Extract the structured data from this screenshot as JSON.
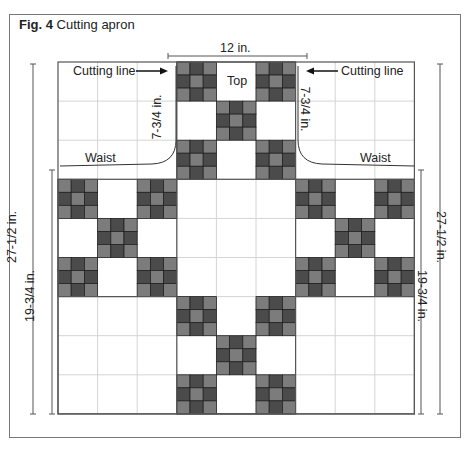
{
  "figure": {
    "number_label": "Fig. 4",
    "title": "Cutting apron"
  },
  "labels": {
    "top_width": "12 in.",
    "top": "Top",
    "cutting_line_left": "Cutting line",
    "cutting_line_right": "Cutting line",
    "cut_depth_left": "7-3/4 in.",
    "cut_depth_right": "7-3/4 in.",
    "waist_left": "Waist",
    "waist_right": "Waist",
    "total_height_left": "27-1/2 in.",
    "total_height_right": "27-1/2 in.",
    "skirt_height_left": "19-3/4 in.",
    "skirt_height_right": "19-3/4 in."
  },
  "colors": {
    "block_medium": "#7c7c7c",
    "block_dark": "#4b4b4b",
    "outline": "#555555",
    "grid_light": "#d4d4d4",
    "frame": "#777777"
  },
  "quilt": {
    "grid_cols": 9,
    "grid_rows": 9,
    "ninepatch_cells": [
      [
        3,
        0
      ],
      [
        5,
        0
      ],
      [
        4,
        1
      ],
      [
        3,
        2
      ],
      [
        5,
        2
      ],
      [
        0,
        3
      ],
      [
        2,
        3
      ],
      [
        6,
        3
      ],
      [
        8,
        3
      ],
      [
        1,
        4
      ],
      [
        7,
        4
      ],
      [
        0,
        5
      ],
      [
        2,
        5
      ],
      [
        6,
        5
      ],
      [
        8,
        5
      ],
      [
        3,
        6
      ],
      [
        5,
        6
      ],
      [
        4,
        7
      ],
      [
        3,
        8
      ],
      [
        5,
        8
      ]
    ]
  }
}
